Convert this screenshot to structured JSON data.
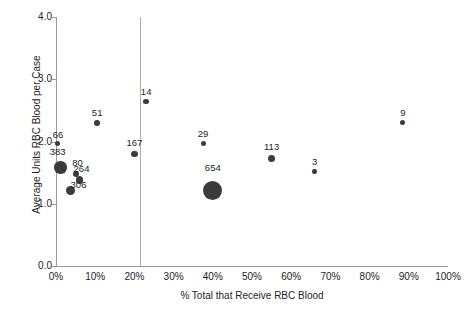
{
  "chart_data": {
    "type": "scatter",
    "title": "",
    "xlabel": "% Total that Receive RBC Blood",
    "ylabel": "Average Units RBC Blood per Case",
    "xlim": [
      0,
      100
    ],
    "ylim": [
      0.0,
      4.0
    ],
    "grid": false,
    "legend": "none",
    "xtick_labels": [
      "0%",
      "10%",
      "20%",
      "30%",
      "40%",
      "50%",
      "60%",
      "70%",
      "80%",
      "90%",
      "100%"
    ],
    "xtick_values": [
      0,
      10,
      20,
      30,
      40,
      50,
      60,
      70,
      80,
      90,
      100
    ],
    "ytick_labels": [
      "0.0",
      "1.0",
      "2.0",
      "3.0",
      "4.0"
    ],
    "ytick_values": [
      0.0,
      1.0,
      2.0,
      3.0,
      4.0
    ],
    "annotations": [
      {
        "name": "vertical-reference-line",
        "x": 24,
        "orientation": "vertical"
      }
    ],
    "marker_color": "#3b3b3b",
    "size_encodes": "case volume (bubble label)",
    "points": [
      {
        "label": "66",
        "x": 0.5,
        "y": 1.97,
        "size": 5.0,
        "label_dx": 0,
        "label_dy": -11
      },
      {
        "label": "383",
        "x": 1.2,
        "y": 1.58,
        "size": 12.5,
        "label_dx": -3,
        "label_dy": -14
      },
      {
        "label": "80",
        "x": 5.0,
        "y": 1.48,
        "size": 6.0,
        "label_dx": 2,
        "label_dy": -13
      },
      {
        "label": "264",
        "x": 6.0,
        "y": 1.38,
        "size": 7.5,
        "label_dx": 2,
        "label_dy": -12
      },
      {
        "label": "306",
        "x": 3.7,
        "y": 1.22,
        "size": 9.0,
        "label_dx": 8,
        "label_dy": -6
      },
      {
        "label": "51",
        "x": 10.5,
        "y": 2.3,
        "size": 5.5,
        "label_dx": 0,
        "label_dy": -12
      },
      {
        "label": "167",
        "x": 20.0,
        "y": 1.8,
        "size": 6.5,
        "label_dx": 0,
        "label_dy": -13
      },
      {
        "label": "14",
        "x": 23.0,
        "y": 2.64,
        "size": 5.5,
        "label_dx": 0,
        "label_dy": -12
      },
      {
        "label": "29",
        "x": 37.5,
        "y": 1.97,
        "size": 5.0,
        "label_dx": 0,
        "label_dy": -12
      },
      {
        "label": "654",
        "x": 40.0,
        "y": 1.22,
        "size": 19.0,
        "label_dx": 0,
        "label_dy": -18
      },
      {
        "label": "113",
        "x": 55.0,
        "y": 1.72,
        "size": 7.0,
        "label_dx": 0,
        "label_dy": -13
      },
      {
        "label": "3",
        "x": 66.0,
        "y": 1.52,
        "size": 4.5,
        "label_dx": 0,
        "label_dy": -12
      },
      {
        "label": "9",
        "x": 88.5,
        "y": 2.3,
        "size": 5.0,
        "label_dx": 0,
        "label_dy": -12
      }
    ]
  }
}
